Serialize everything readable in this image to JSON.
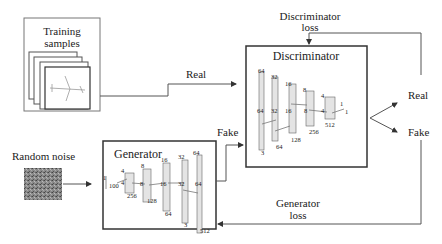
{
  "training": {
    "label_line1": "Training",
    "label_line2": "samples",
    "image_icon": "airplane-icon"
  },
  "noise": {
    "label": "Random noise"
  },
  "edges": {
    "real_label": "Real",
    "fake_label": "Fake",
    "disc_loss_line1": "Discriminator",
    "disc_loss_line2": "loss",
    "gen_loss_line1": "Generator",
    "gen_loss_line2": "loss"
  },
  "outputs": {
    "real": "Real",
    "fake": "Fake"
  },
  "generator": {
    "title": "Generator",
    "layers": [
      {
        "top": "1",
        "mid": "100",
        "bottom": ""
      },
      {
        "top": "4",
        "mid": "4",
        "bottom": "512"
      },
      {
        "top": "8",
        "mid": "8",
        "bottom": "256"
      },
      {
        "top": "16",
        "mid": "16",
        "bottom": "128"
      },
      {
        "top": "32",
        "mid": "32",
        "bottom": "64"
      },
      {
        "top": "64",
        "mid": "64",
        "bottom": "3"
      }
    ]
  },
  "discriminator": {
    "title": "Discriminator",
    "layers": [
      {
        "top": "64",
        "mid": "64",
        "bottom": "3"
      },
      {
        "top": "32",
        "mid": "32",
        "bottom": "64"
      },
      {
        "top": "16",
        "mid": "16",
        "bottom": "128"
      },
      {
        "top": "8",
        "mid": "8",
        "bottom": "256"
      },
      {
        "top": "4",
        "mid": "4",
        "bottom": "512"
      },
      {
        "top": "1",
        "mid": "1",
        "bottom": ""
      }
    ]
  },
  "colors": {
    "line": "#555555",
    "box": "#333333",
    "layer_fill": "#e4e4e4",
    "noise": "#777777"
  }
}
